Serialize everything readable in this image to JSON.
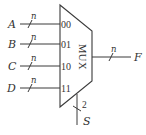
{
  "diagram": {
    "type": "multiplexer",
    "block_label": "MUX",
    "inputs": [
      {
        "signal": "A",
        "bus_width": "n",
        "select_code": "00"
      },
      {
        "signal": "B",
        "bus_width": "n",
        "select_code": "01"
      },
      {
        "signal": "C",
        "bus_width": "n",
        "select_code": "10"
      },
      {
        "signal": "D",
        "bus_width": "n",
        "select_code": "11"
      }
    ],
    "output": {
      "signal": "F",
      "bus_width": "n"
    },
    "select": {
      "signal": "S",
      "bus_width": "2"
    }
  }
}
